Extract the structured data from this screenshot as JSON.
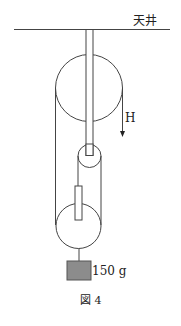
{
  "diagram": {
    "ceiling_label": "天井",
    "force_label": "H",
    "mass_label": "150 g",
    "figure_caption": "図 4",
    "colors": {
      "line": "#444444",
      "weight_fill": "#8c8c8c",
      "weight_stroke": "#555555"
    }
  }
}
